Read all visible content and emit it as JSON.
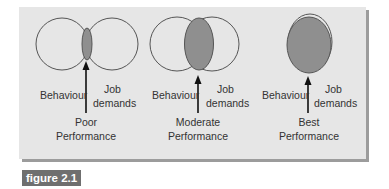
{
  "figure": {
    "caption": "figure 2.1",
    "colors": {
      "panel_bg": "#e6e6e6",
      "panel_shadow": "#9c9c9c",
      "circle_stroke": "#555555",
      "overlap_fill": "#8f8f8f",
      "caption_bg": "#6f6f6f",
      "caption_text": "#ffffff"
    },
    "diagrams": [
      {
        "id": "poor",
        "left_label": "Behaviour",
        "right_label_line1": "Job",
        "right_label_line2": "demands",
        "outcome_line1": "Poor",
        "outcome_line2": "Performance",
        "overlap": "small"
      },
      {
        "id": "moderate",
        "left_label": "Behaviour",
        "right_label_line1": "Job",
        "right_label_line2": "demands",
        "outcome_line1": "Moderate",
        "outcome_line2": "Performance",
        "overlap": "medium"
      },
      {
        "id": "best",
        "left_label": "Behaviour",
        "right_label_line1": "Job",
        "right_label_line2": "demands",
        "outcome_line1": "Best",
        "outcome_line2": "Performance",
        "overlap": "full"
      }
    ]
  }
}
